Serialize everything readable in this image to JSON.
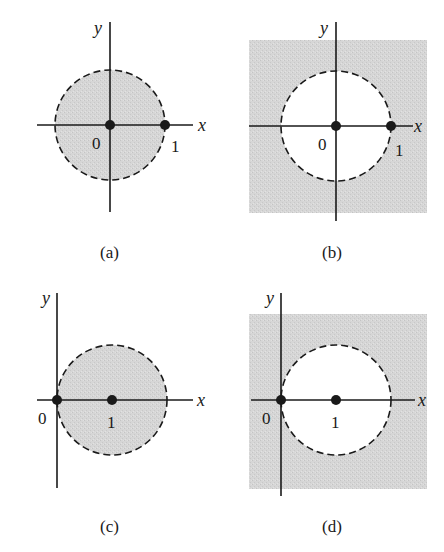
{
  "figure": {
    "panels": [
      {
        "id": "a",
        "caption": "(a)",
        "axis_x_label": "x",
        "axis_y_label": "y",
        "point_labels": [
          "0",
          "1"
        ],
        "description": "Shaded open disk centered at origin, radius 1 (|z| < 1)",
        "shaded_region": "inside",
        "circle_center": [
          0,
          0
        ],
        "circle_radius": 1,
        "boundary": "dashed"
      },
      {
        "id": "b",
        "caption": "(b)",
        "axis_x_label": "x",
        "axis_y_label": "y",
        "point_labels": [
          "0",
          "1"
        ],
        "description": "Shaded exterior of circle centered at origin, radius 1 (|z| > 1)",
        "shaded_region": "outside",
        "circle_center": [
          0,
          0
        ],
        "circle_radius": 1,
        "boundary": "dashed"
      },
      {
        "id": "c",
        "caption": "(c)",
        "axis_x_label": "x",
        "axis_y_label": "y",
        "point_labels": [
          "0",
          "1"
        ],
        "description": "Shaded open disk centered at 1, radius 1 (|z - 1| < 1)",
        "shaded_region": "inside",
        "circle_center": [
          1,
          0
        ],
        "circle_radius": 1,
        "boundary": "dashed"
      },
      {
        "id": "d",
        "caption": "(d)",
        "axis_x_label": "x",
        "axis_y_label": "y",
        "point_labels": [
          "0",
          "1"
        ],
        "description": "Shaded exterior of circle centered at 1, radius 1 (|z - 1| > 1)",
        "shaded_region": "outside",
        "circle_center": [
          1,
          0
        ],
        "circle_radius": 1,
        "boundary": "dashed"
      }
    ],
    "colors": {
      "shade": "#d3d3d3",
      "ink": "#1a1a1a",
      "background": "#ffffff"
    }
  }
}
